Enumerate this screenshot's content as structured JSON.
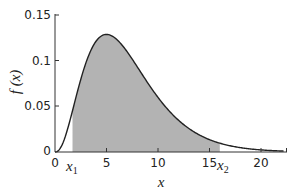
{
  "chart_data": {
    "type": "area",
    "title": "",
    "xlabel": "x",
    "ylabel": "f (x)",
    "xlim": [
      0,
      22.5
    ],
    "ylim": [
      0,
      0.15
    ],
    "x_ticks": [
      "0",
      "5",
      "10",
      "15",
      "20"
    ],
    "y_ticks": [
      "0",
      "0.05",
      "0.1",
      "0.15"
    ],
    "grid": false,
    "legend": null,
    "curve": {
      "description": "right-skewed density (chi-square-like, k = 7)",
      "x": [
        0,
        1,
        2,
        3,
        4,
        5,
        6,
        7,
        8,
        9,
        10,
        11,
        12,
        13,
        14,
        15,
        16,
        17,
        18,
        19,
        20,
        21,
        22
      ],
      "y": [
        0,
        0.0092,
        0.0385,
        0.0734,
        0.102,
        0.1188,
        0.1232,
        0.1174,
        0.1042,
        0.0868,
        0.0683,
        0.0513,
        0.0369,
        0.0256,
        0.0171,
        0.0111,
        0.007,
        0.0043,
        0.0026,
        0.0015,
        0.0009,
        0.0005,
        0.0003
      ]
    },
    "shaded_region": {
      "from": 1.7,
      "to": 16,
      "color": "#b3b3b3"
    },
    "annotations": [
      {
        "text": "x1",
        "x": 1.7,
        "position": "below-axis"
      },
      {
        "text": "x2",
        "x": 16,
        "position": "below-axis"
      }
    ]
  },
  "labels": {
    "y_axis": "f (x)",
    "x_axis": "x",
    "x1": "x",
    "x1_sub": "1",
    "x2": "x",
    "x2_sub": "2"
  },
  "ticks": {
    "x": [
      "0",
      "5",
      "10",
      "15",
      "20"
    ],
    "y": [
      "0",
      "0.05",
      "0.1",
      "0.15"
    ]
  },
  "colors": {
    "curve": "#222222",
    "shade": "#b3b3b3",
    "axis": "#333333"
  }
}
